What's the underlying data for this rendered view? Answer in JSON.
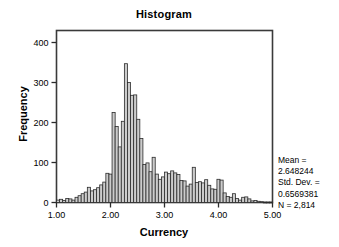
{
  "chart_data": {
    "type": "bar",
    "title": "Histogram",
    "xlabel": "Currency",
    "ylabel": "Frequency",
    "xlim": [
      1.0,
      5.0
    ],
    "ylim": [
      0,
      430
    ],
    "xticks": [
      1.0,
      2.0,
      3.0,
      4.0,
      5.0
    ],
    "xtick_labels": [
      "1.00",
      "2.00",
      "3.00",
      "4.00",
      "5.00"
    ],
    "yticks": [
      0,
      100,
      200,
      300,
      400
    ],
    "ytick_labels": [
      "0",
      "100",
      "200",
      "300",
      "400"
    ],
    "grid": false,
    "legend": "none",
    "bar_fill": "#cccccc",
    "bar_edge": "#2b2b2b",
    "bin_width": 0.0571,
    "bin_starts": [
      1.0,
      1.057,
      1.114,
      1.171,
      1.229,
      1.286,
      1.343,
      1.4,
      1.457,
      1.514,
      1.571,
      1.629,
      1.686,
      1.743,
      1.8,
      1.857,
      1.914,
      1.971,
      2.029,
      2.086,
      2.143,
      2.2,
      2.257,
      2.314,
      2.371,
      2.429,
      2.486,
      2.543,
      2.6,
      2.657,
      2.714,
      2.771,
      2.829,
      2.886,
      2.943,
      3.0,
      3.057,
      3.114,
      3.171,
      3.229,
      3.286,
      3.343,
      3.4,
      3.457,
      3.514,
      3.571,
      3.629,
      3.686,
      3.743,
      3.8,
      3.857,
      3.914,
      3.971,
      4.029,
      4.086,
      4.143,
      4.2,
      4.257,
      4.314,
      4.371,
      4.429,
      4.486,
      4.543,
      4.6,
      4.657,
      4.714,
      4.771,
      4.829,
      4.886,
      4.943
    ],
    "values": [
      6,
      8,
      5,
      10,
      9,
      6,
      13,
      17,
      22,
      26,
      38,
      29,
      32,
      37,
      44,
      51,
      73,
      71,
      225,
      190,
      139,
      203,
      347,
      300,
      268,
      269,
      208,
      160,
      95,
      99,
      77,
      113,
      71,
      58,
      64,
      76,
      72,
      79,
      74,
      70,
      55,
      54,
      41,
      46,
      88,
      50,
      52,
      49,
      57,
      43,
      34,
      33,
      58,
      56,
      24,
      15,
      13,
      22,
      10,
      6,
      13,
      14,
      9,
      4,
      5,
      3,
      2,
      1,
      1,
      1
    ],
    "annotation_lines": [
      "Mean =",
      "2.648244",
      "Std. Dev. =",
      "0.6569381",
      "N = 2,814"
    ],
    "stats": {
      "mean_label": "Mean =",
      "mean_value": "2.648244",
      "sd_label": "Std. Dev. =",
      "sd_value": "0.6569381",
      "n": "N = 2,814"
    }
  }
}
